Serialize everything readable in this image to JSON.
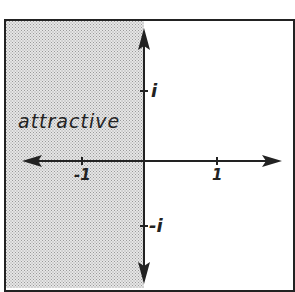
{
  "diagram": {
    "region_label": "attractive",
    "axis_labels": {
      "imag_pos": "i",
      "imag_neg": "-i",
      "real_neg": "-1",
      "real_pos": "1"
    },
    "colors": {
      "shade": "#cfcfcf",
      "ink": "#222222",
      "background": "#ffffff"
    }
  }
}
